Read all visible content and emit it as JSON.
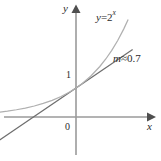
{
  "figure": {
    "background_color": "#ffffff"
  },
  "axes": {
    "y_axis_label": "y",
    "x_axis_label": "x",
    "origin_label": "0",
    "y_intercept_tick_label": "1",
    "axis_color": "#8c8c8c",
    "arrow_color": "#4a4a4a"
  },
  "annotations": {
    "curve_equation": {
      "variable": "y",
      "operator": "=",
      "base": "2",
      "exponent": "x",
      "full_text": "y = 2^x"
    },
    "tangent_slope": {
      "symbol": "m",
      "relation": "≈",
      "value": "0.7",
      "full_text": "m ≈ 0.7"
    }
  },
  "chart_data": {
    "type": "line",
    "title": "",
    "xlabel": "x",
    "ylabel": "y",
    "xlim": [
      -2.9,
      1.9
    ],
    "ylim": [
      -1.4,
      3.6
    ],
    "grid": false,
    "legend": "none",
    "series": [
      {
        "name": "y = 2^x",
        "color": "#b0b0b0",
        "style": "solid",
        "x": [
          -2.9,
          -2.6,
          -2.3,
          -2.0,
          -1.7,
          -1.4,
          -1.1,
          -0.8,
          -0.5,
          -0.2,
          0.0,
          0.2,
          0.5,
          0.8,
          1.0,
          1.2,
          1.4,
          1.6,
          1.75
        ],
        "y": [
          0.134,
          0.165,
          0.203,
          0.25,
          0.308,
          0.379,
          0.467,
          0.574,
          0.707,
          0.871,
          1.0,
          1.149,
          1.414,
          1.741,
          2.0,
          2.297,
          2.639,
          3.031,
          3.363
        ]
      },
      {
        "name": "tangent line at (0, 1), slope 0.7",
        "color": "#6e6e6e",
        "style": "solid",
        "x": [
          -2.6,
          1.9
        ],
        "y": [
          -0.82,
          2.33
        ]
      }
    ],
    "points": [
      {
        "label": "1",
        "x": 0,
        "y": 1,
        "note": "y-intercept tick"
      },
      {
        "label": "0",
        "x": 0,
        "y": 0,
        "note": "origin"
      }
    ],
    "annotations": [
      {
        "text": "y = 2^x",
        "x": 0.95,
        "y": 3.35
      },
      {
        "text": "m ≈ 0.7",
        "x": 1.45,
        "y": 1.95
      }
    ]
  }
}
